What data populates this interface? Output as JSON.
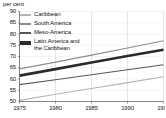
{
  "chart_data": {
    "type": "line",
    "title": "per cent",
    "xlabel": "",
    "ylabel": "per cent",
    "x": [
      1975,
      1980,
      1985,
      1990,
      1995
    ],
    "xlim": [
      1975,
      1995
    ],
    "ylim": [
      50,
      90
    ],
    "ytick_labels": [
      "90",
      "85",
      "80",
      "75",
      "70",
      "65",
      "60",
      "55",
      "50"
    ],
    "ytick_values": [
      90,
      85,
      80,
      75,
      70,
      65,
      60,
      55,
      50
    ],
    "xtick_labels": [
      "1975",
      "1980",
      "1985",
      "1990",
      "1995"
    ],
    "grid": "vertical gridlines at each x tick",
    "legend_position": "top-left inside plot",
    "series": [
      {
        "name": "Caribbean",
        "color": "#b4b4b4",
        "width": 1.1,
        "values": [
          50.5,
          53.2,
          55.8,
          58.4,
          61.0
        ]
      },
      {
        "name": "South America",
        "color": "#8c8c8c",
        "width": 1.1,
        "values": [
          64.5,
          67.5,
          70.6,
          73.8,
          77.0
        ]
      },
      {
        "name": "Meso-America",
        "color": "#585858",
        "width": 1.1,
        "values": [
          57.5,
          59.7,
          61.9,
          64.1,
          66.3
        ]
      },
      {
        "name": "Latin America and\nthe Caribbean",
        "color": "#2b2b2b",
        "width": 2.6,
        "values": [
          61.5,
          64.4,
          67.3,
          70.2,
          73.0
        ]
      }
    ]
  },
  "legend": {
    "items": [
      {
        "label": "Caribbean",
        "color": "#b4b4b4",
        "thickness": "2px",
        "tall": false
      },
      {
        "label": "South America",
        "color": "#8c8c8c",
        "thickness": "2px",
        "tall": false
      },
      {
        "label": "Meso-America",
        "color": "#585858",
        "thickness": "2px",
        "tall": false
      },
      {
        "label": "Latin America and\nthe Caribbean",
        "color": "#2b2b2b",
        "thickness": "4px",
        "tall": true
      }
    ]
  },
  "axes": {
    "title": "per cent"
  }
}
